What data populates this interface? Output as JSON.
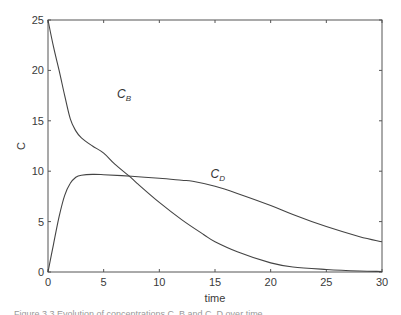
{
  "chart_data": {
    "type": "line",
    "title": "",
    "xlabel": "time",
    "ylabel": "C",
    "xlim": [
      0,
      30
    ],
    "ylim": [
      0,
      25
    ],
    "xticks": [
      0,
      5,
      10,
      15,
      20,
      25,
      30
    ],
    "yticks": [
      0,
      5,
      10,
      15,
      20,
      25
    ],
    "grid": false,
    "legend": "inline labels",
    "series": [
      {
        "name": "C_B",
        "label_main": "C",
        "label_sub": "B",
        "label_pos": [
          6.2,
          17.3
        ],
        "x": [
          0,
          0.5,
          1,
          1.5,
          2,
          2.5,
          3,
          4,
          5,
          6,
          7.3,
          8,
          10,
          12,
          14,
          15,
          17,
          20,
          22,
          25,
          28,
          30
        ],
        "values": [
          25,
          22.3,
          20,
          17.5,
          15.2,
          14,
          13.3,
          12.5,
          11.8,
          10.7,
          9.5,
          8.8,
          6.9,
          5.2,
          3.7,
          3.0,
          2.0,
          0.9,
          0.5,
          0.25,
          0.1,
          0.05
        ]
      },
      {
        "name": "C_D",
        "label_main": "C",
        "label_sub": "D",
        "label_pos": [
          14.6,
          9.3
        ],
        "x": [
          0,
          0.5,
          1,
          1.5,
          2,
          2.5,
          3,
          4,
          5,
          7.5,
          10,
          12,
          13,
          15,
          17,
          20,
          22,
          25,
          28,
          30
        ],
        "values": [
          0,
          2.8,
          5.5,
          7.6,
          8.8,
          9.4,
          9.6,
          9.68,
          9.65,
          9.5,
          9.3,
          9.1,
          9.0,
          8.5,
          7.8,
          6.6,
          5.7,
          4.5,
          3.5,
          3.0
        ]
      }
    ]
  },
  "labels": {
    "xlabel": "time",
    "ylabel": "C"
  },
  "caption": "Figure 3.3  Evolution of concentrations C_B and C_D over time"
}
